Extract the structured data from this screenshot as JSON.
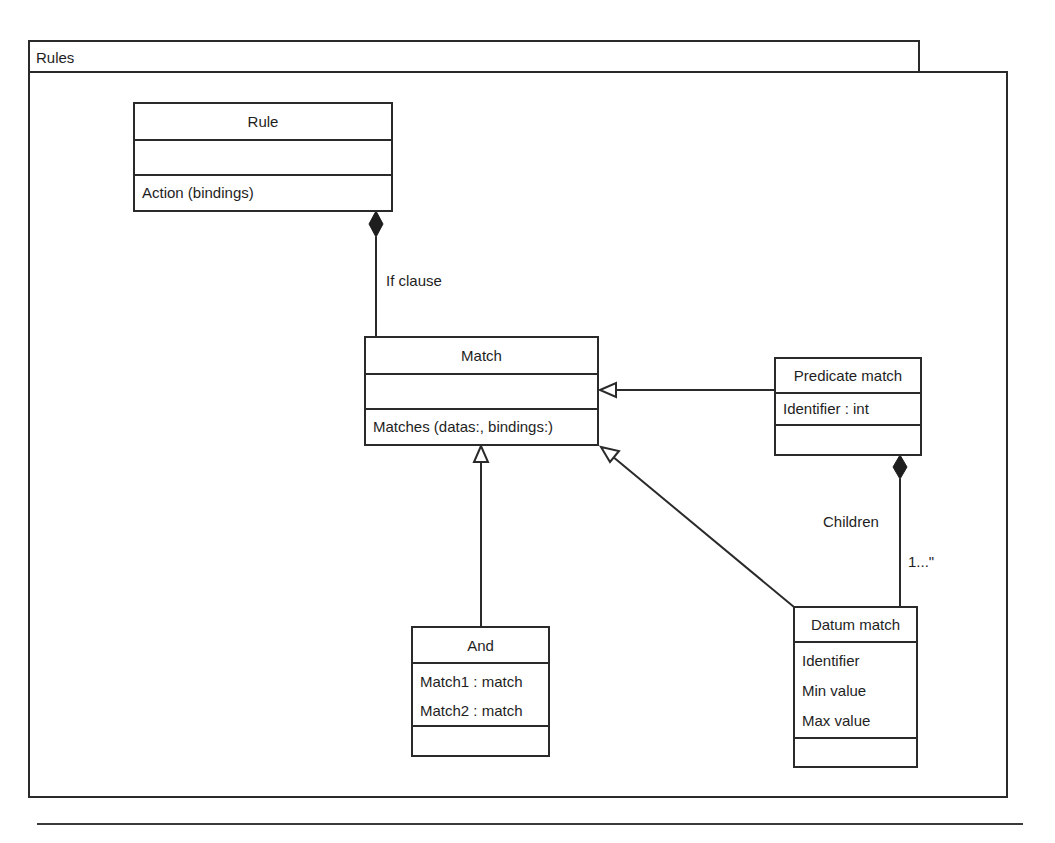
{
  "package": {
    "title": "Rules"
  },
  "classes": {
    "rule": {
      "name": "Rule",
      "attributes": [],
      "operations": [
        "Action (bindings)"
      ]
    },
    "match": {
      "name": "Match",
      "attributes": [],
      "operations": [
        "Matches (datas:, bindings:)"
      ]
    },
    "predicate_match": {
      "name": "Predicate match",
      "attributes": [
        "Identifier : int"
      ],
      "operations": []
    },
    "and": {
      "name": "And",
      "attributes": [
        "Match1 : match",
        "Match2 : match"
      ],
      "operations": []
    },
    "datum_match": {
      "name": "Datum match",
      "attributes": [
        "Identifier",
        "Min value",
        "Max value"
      ],
      "operations": []
    }
  },
  "relationships": [
    {
      "type": "composition",
      "from": "Rule",
      "to": "Match",
      "label": "If clause"
    },
    {
      "type": "generalization",
      "from": "Predicate match",
      "to": "Match"
    },
    {
      "type": "generalization",
      "from": "And",
      "to": "Match"
    },
    {
      "type": "generalization",
      "from": "Datum match",
      "to": "Match"
    },
    {
      "type": "composition",
      "from": "Predicate match",
      "to": "Datum match",
      "label": "Children",
      "multiplicity": "1...\""
    }
  ],
  "labels": {
    "if_clause": "If clause",
    "children": "Children",
    "multiplicity": "1...\""
  }
}
